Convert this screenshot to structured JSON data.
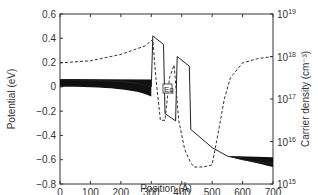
{
  "chart_data": {
    "type": "line",
    "title": "",
    "xlabel": "Position (Å)",
    "ylabel": "Potential (eV)",
    "y2label": "Carrier density (cm⁻³)",
    "xlim": [
      0,
      700
    ],
    "ylim": [
      -0.8,
      0.6
    ],
    "y2lim_log10": [
      15,
      19
    ],
    "x_ticks": [
      "0",
      "100",
      "200",
      "300",
      "400",
      "500",
      "600",
      "700"
    ],
    "y_ticks": [
      "0.6",
      "0.4",
      "0.2",
      "0",
      "−0.2",
      "−0.4",
      "−0.6",
      "−0.8"
    ],
    "y2_ticks": [
      {
        "base": "10",
        "exp": "19"
      },
      {
        "base": "10",
        "exp": "18"
      },
      {
        "base": "10",
        "exp": "17"
      },
      {
        "base": "10",
        "exp": "16"
      },
      {
        "base": "10",
        "exp": "15"
      }
    ],
    "grid": false,
    "annotations": [
      {
        "text": "Eq",
        "x": 365,
        "y": -0.1
      }
    ],
    "series": [
      {
        "name": "Conduction band potential",
        "style": "solid",
        "axis": "left",
        "x": [
          0,
          100,
          200,
          250,
          300,
          305,
          305,
          340,
          345,
          345,
          380,
          385,
          385,
          425,
          430,
          430,
          500,
          550,
          600,
          650,
          700
        ],
        "y": [
          0.06,
          0.055,
          0.045,
          0.03,
          0.0,
          0.42,
          0.42,
          0.35,
          -0.22,
          -0.22,
          -0.28,
          0.25,
          0.25,
          0.17,
          -0.35,
          -0.35,
          -0.5,
          -0.57,
          -0.6,
          -0.62,
          -0.63
        ]
      },
      {
        "name": "Carrier density",
        "style": "dashed",
        "axis": "right",
        "x": [
          0,
          100,
          200,
          280,
          305,
          315,
          330,
          345,
          360,
          375,
          390,
          410,
          430,
          440,
          470,
          500,
          520,
          540,
          560,
          600,
          650,
          700
        ],
        "y_log10": [
          17.85,
          17.9,
          18.05,
          18.25,
          18.4,
          17.5,
          16.5,
          16.5,
          17.5,
          17.8,
          16.5,
          15.8,
          15.5,
          15.4,
          15.4,
          15.45,
          16.2,
          17.0,
          17.5,
          17.85,
          17.95,
          18.0
        ]
      }
    ]
  }
}
